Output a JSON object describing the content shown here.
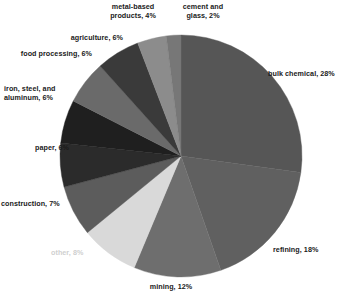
{
  "chart_data": {
    "type": "pie",
    "title": "",
    "subtitle": "",
    "xlabel": "",
    "ylabel": "",
    "legend_position": "none",
    "grid": false,
    "units": "percent",
    "total": 103,
    "start_angle_deg": 0,
    "direction": "clockwise",
    "categories": [
      "bulk chemical",
      "refining",
      "mining",
      "other",
      "construction",
      "paper",
      "iron, steel, and aluminum",
      "food processing",
      "agriculture",
      "metal-based products",
      "cement and glass"
    ],
    "values": [
      28,
      18,
      12,
      8,
      7,
      6,
      6,
      6,
      6,
      4,
      2
    ],
    "slices": [
      {
        "name": "bulk chemical",
        "value": 28,
        "label": "bulk chemical, 28%",
        "color": "#565656",
        "label_color": "#1a1a1a",
        "label_align": "left"
      },
      {
        "name": "refining",
        "value": 18,
        "label": "refining, 18%",
        "color": "#606060",
        "label_color": "#1a1a1a",
        "label_align": "left"
      },
      {
        "name": "mining",
        "value": 12,
        "label": "mining, 12%",
        "color": "#6e6e6e",
        "label_color": "#1a1a1a",
        "label_align": "center"
      },
      {
        "name": "other",
        "value": 8,
        "label": "other, 8%",
        "color": "#d9d9d9",
        "label_color": "#cfcfcf",
        "label_align": "left"
      },
      {
        "name": "construction",
        "value": 7,
        "label": "construction, 7%",
        "color": "#5c5c5c",
        "label_color": "#1a1a1a",
        "label_align": "right"
      },
      {
        "name": "paper",
        "value": 6,
        "label": "paper, 6%",
        "color": "#2b2b2b",
        "label_color": "#1a1a1a",
        "label_align": "right"
      },
      {
        "name": "iron, steel, and aluminum",
        "value": 6,
        "label": "iron, steel, and\naluminum, 6%",
        "color": "#1f1f1f",
        "label_color": "#1a1a1a",
        "label_align": "left"
      },
      {
        "name": "food processing",
        "value": 6,
        "label": "food processing, 6%",
        "color": "#6a6a6a",
        "label_color": "#1a1a1a",
        "label_align": "right"
      },
      {
        "name": "agriculture",
        "value": 6,
        "label": "agriculture, 6%",
        "color": "#3a3a3a",
        "label_color": "#1a1a1a",
        "label_align": "right"
      },
      {
        "name": "metal-based products",
        "value": 4,
        "label": "metal-based\nproducts, 4%",
        "color": "#8c8c8c",
        "label_color": "#9a9a9a",
        "label_align": "center"
      },
      {
        "name": "cement and glass",
        "value": 2,
        "label": "cement and\nglass, 2%",
        "color": "#777777",
        "label_color": "#1a1a1a",
        "label_align": "center"
      }
    ],
    "geometry": {
      "center_x": 181,
      "center_y": 156,
      "radius": 121,
      "background": "#ffffff"
    }
  }
}
